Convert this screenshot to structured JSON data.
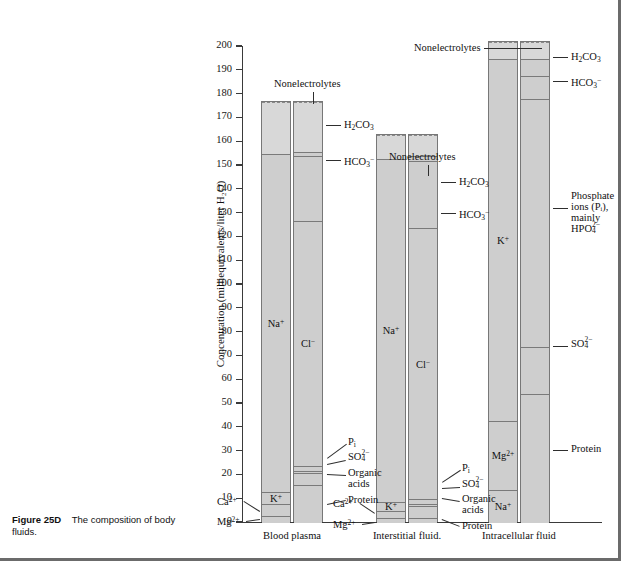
{
  "caption": {
    "figure_number": "Figure 25D",
    "text": "The composition of body fluids."
  },
  "chart_data": {
    "type": "bar",
    "title": "",
    "xlabel": "",
    "ylabel": "Concentration (milliequivalents/liter H₂O)",
    "ylim": [
      0,
      200
    ],
    "ytick_step": 10,
    "ytick_labels": [
      "0",
      "10",
      "20",
      "30",
      "40",
      "50",
      "60",
      "70",
      "80",
      "90",
      "100",
      "110",
      "120",
      "130",
      "140",
      "150",
      "160",
      "170",
      "180",
      "190",
      "200"
    ],
    "grid": false,
    "legend": "none",
    "categories": [
      "Blood plasma",
      "Interstitial fluid.",
      "Intracellular fluid"
    ],
    "columns": [
      {
        "category": "Blood plasma",
        "cation_total": 155,
        "anion_total": 155,
        "nonelectrolyte_top": 177,
        "cations": [
          {
            "name": "Mg²⁺",
            "value": 3,
            "label_inside": "",
            "callout": "Mg2+"
          },
          {
            "name": "Ca²⁺",
            "value": 5,
            "label_inside": "",
            "callout": "Ca2+"
          },
          {
            "name": "K⁺",
            "value": 5,
            "label_inside": "K⁺",
            "callout": ""
          },
          {
            "name": "Na⁺",
            "value": 142,
            "label_inside": "Na⁺",
            "callout": ""
          }
        ],
        "anions": [
          {
            "name": "Protein",
            "value": 16,
            "label_inside": "",
            "callout": "Protein"
          },
          {
            "name": "Organic acids",
            "value": 5,
            "label_inside": "",
            "callout": "Organic acids"
          },
          {
            "name": "SO4 2-",
            "value": 1,
            "label_inside": "",
            "callout": "SO4 2-"
          },
          {
            "name": "Pi",
            "value": 2,
            "label_inside": "",
            "callout": "Pi"
          },
          {
            "name": "Cl⁻",
            "value": 103,
            "label_inside": "Cl⁻",
            "callout": ""
          },
          {
            "name": "HCO3⁻",
            "value": 27,
            "label_inside": "",
            "callout": "HCO3-"
          },
          {
            "name": "H2CO3",
            "value": 2,
            "label_inside": "",
            "callout": "H2CO3"
          }
        ]
      },
      {
        "category": "Interstitial fluid.",
        "cation_total": 153,
        "anion_total": 153,
        "nonelectrolyte_top": 163,
        "cations": [
          {
            "name": "Mg²⁺",
            "value": 2,
            "label_inside": "",
            "callout": "Mg2+"
          },
          {
            "name": "Ca²⁺",
            "value": 3,
            "label_inside": "",
            "callout": "Ca2+"
          },
          {
            "name": "K⁺",
            "value": 4,
            "label_inside": "K⁺",
            "callout": ""
          },
          {
            "name": "Na⁺",
            "value": 144,
            "label_inside": "Na⁺",
            "callout": ""
          }
        ],
        "anions": [
          {
            "name": "Protein",
            "value": 2,
            "label_inside": "",
            "callout": "Protein"
          },
          {
            "name": "Organic acids",
            "value": 5,
            "label_inside": "",
            "callout": "Organic acids"
          },
          {
            "name": "SO4 2-",
            "value": 1,
            "label_inside": "",
            "callout": "SO4 2-"
          },
          {
            "name": "Pi",
            "value": 2,
            "label_inside": "",
            "callout": "Pi"
          },
          {
            "name": "Cl⁻",
            "value": 114,
            "label_inside": "Cl⁻",
            "callout": ""
          },
          {
            "name": "HCO3⁻",
            "value": 28,
            "label_inside": "",
            "callout": "HCO3-"
          },
          {
            "name": "H2CO3",
            "value": 2,
            "label_inside": "",
            "callout": "H2CO3"
          }
        ]
      },
      {
        "category": "Intracellular fluid",
        "cation_total": 195,
        "anion_total": 195,
        "nonelectrolyte_top": 202,
        "cations": [
          {
            "name": "Na⁺",
            "value": 14,
            "label_inside": "Na⁺",
            "callout": ""
          },
          {
            "name": "Mg²⁺",
            "value": 29,
            "label_inside": "Mg²⁺",
            "callout": ""
          },
          {
            "name": "K⁺",
            "value": 152,
            "label_inside": "K⁺",
            "callout": ""
          }
        ],
        "anions": [
          {
            "name": "Protein",
            "value": 54,
            "label_inside": "",
            "callout": "Protein"
          },
          {
            "name": "SO4 2-",
            "value": 20,
            "label_inside": "",
            "callout": "SO4 2-"
          },
          {
            "name": "Phosphate",
            "value": 104,
            "label_inside": "",
            "callout": "Phosphate ions (Pi), mainly HPO4 2-"
          },
          {
            "name": "HCO3⁻",
            "value": 10,
            "label_inside": "",
            "callout": "HCO3-"
          },
          {
            "name": "H2CO3",
            "value": 7,
            "label_inside": "",
            "callout": "H2CO3"
          }
        ]
      }
    ],
    "annotations": {
      "nonelectrolytes": "Nonelectrolytes",
      "h2co3": "H₂CO₃",
      "hco3": "HCO₃⁻",
      "protein": "Protein",
      "organic_acids_line1": "Organic",
      "organic_acids_line2": "acids",
      "phosphate_line1": "Phosphate",
      "phosphate_line2": "ions (Pᵢ),",
      "phosphate_line3": "mainly",
      "phosphate_line4": "HPO₄²⁻"
    }
  }
}
